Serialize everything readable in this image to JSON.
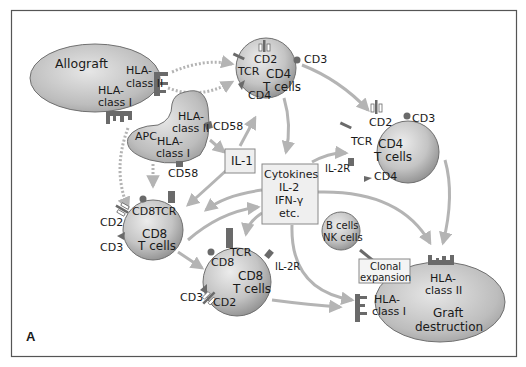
{
  "figure": {
    "panel_label": "A",
    "colors": {
      "frame": "#555555",
      "cell_fill_light": "#e2e2e2",
      "cell_fill_dark": "#9a9a9a",
      "arrow": "#b4b4b4",
      "receptor": "#6a6a6a",
      "box_fill": "#efefef",
      "box_border": "#888888"
    }
  },
  "nodes": {
    "allograft": {
      "title": "Allograft",
      "hla2_l1": "HLA-",
      "hla2_l2": "class II",
      "hla1_l1": "HLA-",
      "hla1_l2": "class I"
    },
    "apc": {
      "title": "APC",
      "hla2_l1": "HLA-",
      "hla2_l2": "class II",
      "hla1_l1": "HLA-",
      "hla1_l2": "class I",
      "cd58_a": "CD58",
      "cd58_b": "CD58"
    },
    "cd4_top": {
      "l1": "CD4",
      "l2": "T cells",
      "cd2": "CD2",
      "cd3": "CD3",
      "tcr": "TCR",
      "cd4": "CD4"
    },
    "cd4_right": {
      "l1": "CD4",
      "l2": "T cells",
      "cd2": "CD2",
      "cd3": "CD3",
      "tcr": "TCR",
      "cd4": "CD4",
      "il2r": "IL-2R"
    },
    "il1": {
      "label": "IL-1"
    },
    "cytokines": {
      "l1": "Cytokines",
      "l2": "IL-2",
      "l3": "IFN-γ",
      "l4": "etc."
    },
    "cd8_left": {
      "l1": "CD8",
      "l2": "T cells",
      "cd8": "CD8",
      "tcr": "TCR",
      "cd2": "CD2",
      "cd3": "CD3"
    },
    "cd8_bottom": {
      "l1": "CD8",
      "l2": "T cells",
      "cd8": "CD8",
      "tcr": "TCR",
      "cd2": "CD2",
      "cd3": "CD3",
      "il2r": "IL-2R"
    },
    "bnk": {
      "l1": "B cells",
      "l2": "NK cells"
    },
    "clonal": {
      "l1": "Clonal",
      "l2": "expansion"
    },
    "graft": {
      "l1": "Graft",
      "l2": "destruction",
      "hla2_l1": "HLA-",
      "hla2_l2": "class II",
      "hla1_l1": "HLA-",
      "hla1_l2": "class I"
    }
  }
}
